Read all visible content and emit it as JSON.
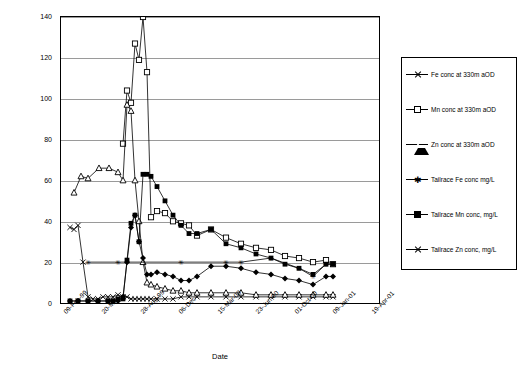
{
  "chart_data": {
    "type": "line",
    "title": "",
    "xlabel": "Date",
    "ylabel": "Metal concentration (mg/l)",
    "ylim": [
      0,
      140
    ],
    "yticks": [
      0,
      20,
      40,
      60,
      80,
      100,
      120,
      140
    ],
    "xticks": [
      "09-Feb-99",
      "20-May...",
      "28-Aug-99",
      "06-Dec-",
      "15-Mar-00",
      "23-Jun-00",
      "01-Oct-00",
      "09-Jan-01",
      "19-Apr-01"
    ],
    "grid": true,
    "legend_position": "right",
    "series": [
      {
        "name": "Fe conc at 330m aOD",
        "marker": "x",
        "points": [
          [
            9,
            37
          ],
          [
            13,
            36
          ],
          [
            17,
            38
          ],
          [
            22,
            20
          ],
          [
            27,
            3
          ],
          [
            32,
            2
          ],
          [
            37,
            2
          ],
          [
            42,
            3
          ],
          [
            47,
            3
          ],
          [
            52,
            3
          ],
          [
            57,
            4
          ],
          [
            62,
            3
          ],
          [
            66,
            3
          ],
          [
            70,
            2
          ],
          [
            74,
            2
          ],
          [
            78,
            2
          ],
          [
            82,
            2
          ],
          [
            86,
            2
          ],
          [
            90,
            2
          ],
          [
            96,
            2
          ],
          [
            104,
            2
          ],
          [
            112,
            2
          ],
          [
            120,
            3
          ],
          [
            128,
            3
          ],
          [
            136,
            3
          ],
          [
            150,
            3
          ],
          [
            165,
            3
          ],
          [
            180,
            3
          ],
          [
            195,
            3
          ],
          [
            210,
            3
          ],
          [
            224,
            3
          ],
          [
            238,
            3
          ],
          [
            252,
            3
          ],
          [
            265,
            3
          ],
          [
            272,
            3
          ]
        ]
      },
      {
        "name": "Mn conc at 330m aOD",
        "marker": "square-open",
        "points": [
          [
            62,
            78
          ],
          [
            66,
            104
          ],
          [
            70,
            98
          ],
          [
            74,
            127
          ],
          [
            78,
            119
          ],
          [
            82,
            140
          ],
          [
            86,
            113
          ],
          [
            90,
            42
          ],
          [
            96,
            45
          ],
          [
            104,
            44
          ],
          [
            112,
            40
          ],
          [
            120,
            39
          ],
          [
            128,
            38
          ],
          [
            136,
            33
          ],
          [
            150,
            36
          ],
          [
            165,
            32
          ],
          [
            180,
            29
          ],
          [
            195,
            27
          ],
          [
            210,
            26
          ],
          [
            224,
            23
          ],
          [
            238,
            22
          ],
          [
            252,
            20
          ],
          [
            265,
            21
          ],
          [
            272,
            19
          ]
        ]
      },
      {
        "name": "Zn conc at 330m aOD",
        "marker": "triangle-open",
        "points": [
          [
            13,
            54
          ],
          [
            20,
            62
          ],
          [
            27,
            61
          ],
          [
            38,
            66
          ],
          [
            48,
            66
          ],
          [
            57,
            64
          ],
          [
            62,
            60
          ],
          [
            66,
            97
          ],
          [
            70,
            94
          ],
          [
            74,
            60
          ],
          [
            78,
            40
          ],
          [
            82,
            20
          ],
          [
            86,
            10
          ],
          [
            90,
            9
          ],
          [
            96,
            8
          ],
          [
            104,
            7
          ],
          [
            112,
            6
          ],
          [
            120,
            6
          ],
          [
            128,
            5
          ],
          [
            136,
            5
          ],
          [
            150,
            5
          ],
          [
            165,
            5
          ],
          [
            180,
            5
          ],
          [
            195,
            4
          ],
          [
            210,
            4
          ],
          [
            224,
            4
          ],
          [
            238,
            4
          ],
          [
            252,
            4
          ],
          [
            265,
            4
          ],
          [
            272,
            4
          ]
        ]
      },
      {
        "name": "Tailrace Fe conc mg/L",
        "marker": "star",
        "points": [
          [
            27,
            20
          ],
          [
            57,
            20
          ],
          [
            120,
            20
          ],
          [
            165,
            20
          ],
          [
            180,
            20
          ],
          [
            210,
            22
          ],
          [
            238,
            17
          ],
          [
            252,
            13
          ],
          [
            265,
            19
          ],
          [
            272,
            19
          ]
        ]
      },
      {
        "name": "Tailrace Mn conc, mg/L",
        "marker": "square-fill",
        "points": [
          [
            9,
            1
          ],
          [
            17,
            1
          ],
          [
            27,
            1
          ],
          [
            37,
            1
          ],
          [
            47,
            1
          ],
          [
            52,
            1
          ],
          [
            57,
            2
          ],
          [
            62,
            2
          ],
          [
            66,
            21
          ],
          [
            70,
            39
          ],
          [
            74,
            43
          ],
          [
            78,
            30
          ],
          [
            82,
            63
          ],
          [
            86,
            63
          ],
          [
            90,
            62
          ],
          [
            96,
            57
          ],
          [
            104,
            50
          ],
          [
            112,
            43
          ],
          [
            120,
            38
          ],
          [
            128,
            34
          ],
          [
            136,
            34
          ],
          [
            150,
            36
          ],
          [
            165,
            29
          ],
          [
            180,
            27
          ],
          [
            195,
            24
          ],
          [
            210,
            22
          ],
          [
            224,
            19
          ],
          [
            238,
            17
          ],
          [
            252,
            14
          ],
          [
            265,
            19
          ],
          [
            272,
            19
          ]
        ]
      },
      {
        "name": "Tailrace Zn conc, mg/L",
        "marker": "diamond",
        "points": [
          [
            9,
            1
          ],
          [
            17,
            1
          ],
          [
            27,
            1
          ],
          [
            37,
            1
          ],
          [
            47,
            1
          ],
          [
            52,
            1
          ],
          [
            57,
            1
          ],
          [
            62,
            3
          ],
          [
            66,
            20
          ],
          [
            70,
            37
          ],
          [
            74,
            43
          ],
          [
            78,
            30
          ],
          [
            82,
            22
          ],
          [
            86,
            14
          ],
          [
            90,
            14
          ],
          [
            96,
            15
          ],
          [
            104,
            14
          ],
          [
            112,
            13
          ],
          [
            120,
            11
          ],
          [
            128,
            11
          ],
          [
            136,
            13
          ],
          [
            150,
            18
          ],
          [
            165,
            18
          ],
          [
            180,
            17
          ],
          [
            195,
            15
          ],
          [
            210,
            14
          ],
          [
            224,
            12
          ],
          [
            238,
            11
          ],
          [
            252,
            9
          ],
          [
            265,
            13
          ],
          [
            272,
            13
          ]
        ]
      }
    ],
    "legend_entries": [
      {
        "label": "Fe conc at 330m aOD",
        "marker": "x"
      },
      {
        "label": "Mn conc at 330m aOD",
        "marker": "square-open"
      },
      {
        "label": "Zn conc at 330m aOD",
        "marker": "triangle-open"
      },
      {
        "label": "Tailrace Fe conc mg/L",
        "marker": "star"
      },
      {
        "label": "Tailrace Mn conc, mg/L",
        "marker": "square-fill"
      },
      {
        "label": "Tailrace Zn conc, mg/L",
        "marker": "x"
      }
    ]
  }
}
